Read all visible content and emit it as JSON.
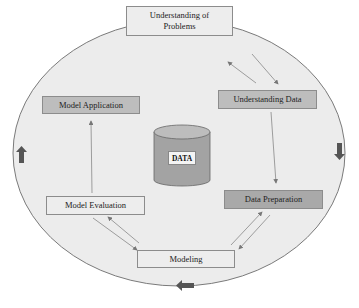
{
  "diagram": {
    "title": "",
    "center": {
      "label": "DATA",
      "shape": "cylinder"
    },
    "nodes": [
      {
        "id": "understanding-problems",
        "label": "Understanding of Problems",
        "line1": "Understanding of",
        "line2": "Problems"
      },
      {
        "id": "understanding-data",
        "label": "Understanding Data"
      },
      {
        "id": "data-preparation",
        "label": "Data Preparation"
      },
      {
        "id": "modeling",
        "label": "Modeling"
      },
      {
        "id": "model-evaluation",
        "label": "Model Evaluation"
      },
      {
        "id": "model-application",
        "label": "Model Application"
      }
    ],
    "edges": [
      {
        "from": "understanding-problems",
        "to": "understanding-data",
        "bidirectional": true
      },
      {
        "from": "understanding-data",
        "to": "data-preparation",
        "bidirectional": false
      },
      {
        "from": "data-preparation",
        "to": "modeling",
        "bidirectional": true
      },
      {
        "from": "modeling",
        "to": "model-evaluation",
        "bidirectional": true
      },
      {
        "from": "model-evaluation",
        "to": "model-application",
        "bidirectional": false
      }
    ],
    "cycle_direction": "clockwise",
    "cycle_arrows": [
      "right-top",
      "down-right",
      "left-bottom",
      "up-left"
    ],
    "colors": {
      "ellipse_fill": "#ececec",
      "ellipse_stroke": "#7a7a7a",
      "cycle_arrow": "#555555",
      "cylinder": "#a3a3a3"
    }
  }
}
